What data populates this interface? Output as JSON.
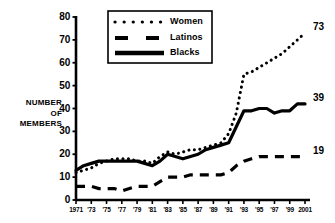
{
  "chart_data": {
    "type": "line",
    "title": "",
    "xlabel": "",
    "ylabel": "NUMBER OF MEMBERS",
    "ylabel_lines": [
      "NUMBER",
      "OF",
      "MEMBERS"
    ],
    "xlim": [
      1971,
      2001
    ],
    "ylim": [
      0,
      80
    ],
    "yticks": [
      0,
      10,
      20,
      30,
      40,
      50,
      60,
      70,
      80
    ],
    "ytick_labels": [
      "0",
      "10",
      "20",
      "30",
      "40",
      "50",
      "60",
      "70",
      "80"
    ],
    "xticks": [
      1971,
      1973,
      1975,
      1977,
      1979,
      1981,
      1983,
      1985,
      1987,
      1989,
      1991,
      1993,
      1995,
      1997,
      1999,
      2001
    ],
    "xtick_labels": [
      "1971",
      "'73",
      "'75",
      "'77",
      "'79",
      "'81",
      "'83",
      "'85",
      "'87",
      "'89",
      "'91",
      "'93",
      "'95",
      "'97",
      "'99",
      "2001"
    ],
    "grid": false,
    "legend_position": "top-center",
    "x": [
      1971,
      1972,
      1973,
      1974,
      1975,
      1976,
      1977,
      1978,
      1979,
      1980,
      1981,
      1982,
      1983,
      1984,
      1985,
      1986,
      1987,
      1988,
      1989,
      1990,
      1991,
      1992,
      1993,
      1994,
      1995,
      1996,
      1997,
      1998,
      1999,
      2000,
      2001
    ],
    "series": [
      {
        "name": "Women",
        "style": "dotted",
        "end_label": "73",
        "values": [
          12,
          13,
          14,
          16,
          17,
          18,
          18,
          18,
          17,
          17,
          16,
          19,
          21,
          20,
          21,
          22,
          22,
          23,
          24,
          25,
          29,
          38,
          55,
          56,
          58,
          60,
          62,
          64,
          67,
          70,
          73
        ]
      },
      {
        "name": "Latinos",
        "style": "dashed",
        "end_label": "19",
        "values": [
          6,
          6,
          6,
          5,
          5,
          5,
          4,
          5,
          6,
          6,
          6,
          8,
          10,
          10,
          10,
          11,
          11,
          11,
          11,
          11,
          12,
          15,
          17,
          18,
          19,
          19,
          19,
          19,
          19,
          19,
          19
        ]
      },
      {
        "name": "Blacks",
        "style": "solid",
        "end_label": "39",
        "values": [
          13,
          15,
          16,
          17,
          17,
          17,
          17,
          17,
          17,
          16,
          15,
          17,
          20,
          19,
          18,
          19,
          20,
          22,
          23,
          24,
          25,
          32,
          39,
          39,
          40,
          40,
          38,
          39,
          39,
          42,
          42
        ]
      }
    ]
  },
  "legend": {
    "items": [
      {
        "label": "Women",
        "style": "dotted"
      },
      {
        "label": "Latinos",
        "style": "dashed"
      },
      {
        "label": "Blacks",
        "style": "solid"
      }
    ]
  },
  "colors": {
    "ink": "#000000",
    "background": "#ffffff"
  }
}
